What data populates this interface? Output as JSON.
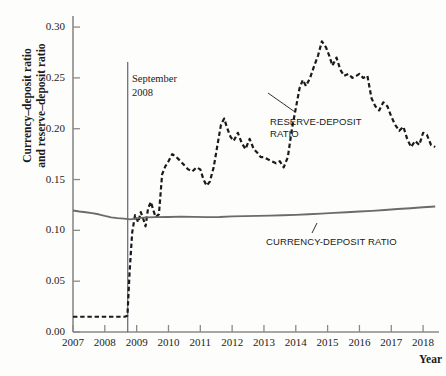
{
  "chart_data": {
    "type": "line",
    "title": "",
    "xlabel": "Year",
    "ylabel": "Currency–deposit ratio and reserve–deposit ratio",
    "ylabel_line1": "Currency–deposit ratio",
    "ylabel_line2": "and reserve–deposit ratio",
    "xlim": [
      2007,
      2018.5
    ],
    "ylim": [
      0.0,
      0.305
    ],
    "grid": false,
    "legend_position": "inline-annotations",
    "yticks": [
      "0.00",
      "0.05",
      "0.10",
      "0.15",
      "0.20",
      "0.25",
      "0.30"
    ],
    "ytick_values": [
      0.0,
      0.05,
      0.1,
      0.15,
      0.2,
      0.25,
      0.3
    ],
    "xticks": [
      "2007",
      "2008",
      "2009",
      "2010",
      "2011",
      "2012",
      "2013",
      "2014",
      "2015",
      "2016",
      "2017",
      "2018"
    ],
    "xtick_values": [
      2007,
      2008,
      2009,
      2010,
      2011,
      2012,
      2013,
      2014,
      2015,
      2016,
      2017,
      2018
    ],
    "annotations": [
      {
        "name": "september-2008-event",
        "text": "September\n2008",
        "x": 2008.72,
        "style": "vertical-rule"
      },
      {
        "name": "reserve-deposit-ratio-label",
        "text": "RESERVE-DEPOSIT\nRATIO",
        "leader": true
      },
      {
        "name": "currency-deposit-ratio-label",
        "text": "CURRENCY-DEPOSIT RATIO",
        "leader": true
      }
    ],
    "series": [
      {
        "name": "RESERVE-DEPOSIT RATIO",
        "style": "dashed",
        "color": "#1a1a1a",
        "x": [
          2007.0,
          2007.2,
          2007.45,
          2007.7,
          2007.95,
          2008.2,
          2008.45,
          2008.62,
          2008.71,
          2008.78,
          2008.86,
          2008.95,
          2009.05,
          2009.13,
          2009.2,
          2009.28,
          2009.36,
          2009.45,
          2009.52,
          2009.6,
          2009.7,
          2009.8,
          2009.9,
          2010.0,
          2010.12,
          2010.25,
          2010.38,
          2010.5,
          2010.62,
          2010.75,
          2010.88,
          2011.0,
          2011.1,
          2011.2,
          2011.3,
          2011.42,
          2011.55,
          2011.65,
          2011.75,
          2011.85,
          2011.95,
          2012.05,
          2012.18,
          2012.3,
          2012.42,
          2012.55,
          2012.68,
          2012.8,
          2012.9,
          2013.0,
          2013.12,
          2013.25,
          2013.38,
          2013.5,
          2013.62,
          2013.75,
          2013.88,
          2014.0,
          2014.12,
          2014.22,
          2014.32,
          2014.45,
          2014.58,
          2014.7,
          2014.82,
          2014.95,
          2015.05,
          2015.15,
          2015.28,
          2015.4,
          2015.52,
          2015.65,
          2015.78,
          2015.9,
          2016.0,
          2016.12,
          2016.25,
          2016.38,
          2016.5,
          2016.62,
          2016.75,
          2016.88,
          2017.0,
          2017.12,
          2017.25,
          2017.38,
          2017.5,
          2017.62,
          2017.75,
          2017.88,
          2018.0,
          2018.12,
          2018.25,
          2018.38
        ],
        "y": [
          0.015,
          0.015,
          0.015,
          0.015,
          0.015,
          0.015,
          0.015,
          0.015,
          0.016,
          0.06,
          0.098,
          0.115,
          0.108,
          0.118,
          0.112,
          0.104,
          0.122,
          0.128,
          0.12,
          0.113,
          0.116,
          0.155,
          0.163,
          0.168,
          0.175,
          0.172,
          0.168,
          0.164,
          0.16,
          0.158,
          0.162,
          0.16,
          0.15,
          0.144,
          0.148,
          0.162,
          0.186,
          0.204,
          0.21,
          0.2,
          0.192,
          0.188,
          0.196,
          0.186,
          0.18,
          0.19,
          0.18,
          0.176,
          0.172,
          0.172,
          0.17,
          0.168,
          0.166,
          0.168,
          0.162,
          0.172,
          0.2,
          0.22,
          0.24,
          0.248,
          0.242,
          0.25,
          0.262,
          0.272,
          0.286,
          0.28,
          0.272,
          0.262,
          0.27,
          0.258,
          0.252,
          0.254,
          0.25,
          0.252,
          0.254,
          0.25,
          0.252,
          0.23,
          0.222,
          0.218,
          0.226,
          0.222,
          0.212,
          0.204,
          0.198,
          0.202,
          0.19,
          0.182,
          0.188,
          0.184,
          0.196,
          0.194,
          0.184,
          0.182
        ]
      },
      {
        "name": "CURRENCY-DEPOSIT RATIO",
        "style": "solid",
        "color": "#6b6b6b",
        "x": [
          2007.0,
          2007.2,
          2007.4,
          2007.6,
          2007.8,
          2008.0,
          2008.2,
          2008.4,
          2008.6,
          2008.8,
          2009.0,
          2009.3,
          2009.6,
          2010.0,
          2010.4,
          2010.8,
          2011.2,
          2011.6,
          2012.0,
          2012.4,
          2012.8,
          2013.2,
          2013.6,
          2014.0,
          2014.4,
          2014.8,
          2015.2,
          2015.6,
          2016.0,
          2016.4,
          2016.8,
          2017.2,
          2017.6,
          2018.0,
          2018.38
        ],
        "y": [
          0.1195,
          0.1185,
          0.1178,
          0.117,
          0.1158,
          0.1142,
          0.1128,
          0.112,
          0.1115,
          0.1108,
          0.1118,
          0.1128,
          0.113,
          0.1132,
          0.1135,
          0.1133,
          0.113,
          0.1132,
          0.1138,
          0.114,
          0.1143,
          0.1145,
          0.1148,
          0.1152,
          0.1158,
          0.1165,
          0.1172,
          0.1178,
          0.1185,
          0.1192,
          0.12,
          0.121,
          0.1218,
          0.1228,
          0.1235
        ]
      }
    ]
  },
  "axis_style": {
    "axis_color": "#8a8a8a",
    "tick_color": "#8a8a8a",
    "event_line_color": "#55556b",
    "background": "#fdfdfb"
  }
}
